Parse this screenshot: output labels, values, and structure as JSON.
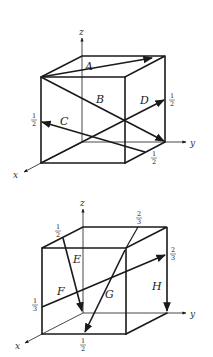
{
  "figure": {
    "panels": [
      {
        "id": "top",
        "axes": {
          "x": "x",
          "y": "y",
          "z": "z"
        },
        "vectors": [
          {
            "label": "A",
            "description": "top face diagonal from front-top-left corner to back-top-right region"
          },
          {
            "label": "B",
            "description": "body diagonal from front-top-left corner to back-bottom-right corner"
          },
          {
            "label": "C",
            "description": "from 1/2 point on bottom-right edge to 1/2 point on front-left vertical edge"
          },
          {
            "label": "D",
            "description": "from front-bottom-left corner to 1/2 point on back-right vertical edge"
          }
        ],
        "fractions": [
          {
            "value": "1/2",
            "num": "1",
            "den": "2",
            "position": "back-right edge (D tip)"
          },
          {
            "value": "1/2",
            "num": "1",
            "den": "2",
            "position": "front-left edge (C tip)"
          },
          {
            "value": "1/2",
            "num": "1",
            "den": "2",
            "position": "bottom-right edge (C tail)"
          }
        ]
      },
      {
        "id": "bottom",
        "axes": {
          "x": "x",
          "y": "y",
          "z": "z"
        },
        "vectors": [
          {
            "label": "E",
            "description": "from 1/2 point on top-left edge down to origin"
          },
          {
            "label": "F",
            "description": "from 1/3 point on front-left edge to 2/3 point on back-right edge"
          },
          {
            "label": "G",
            "description": "from 2/3 point on top-back edge through front-top-right corner to 1/2 point on front-bottom edge"
          },
          {
            "label": "H",
            "description": "down the back-right vertical edge"
          }
        ],
        "fractions": [
          {
            "value": "1/2",
            "num": "1",
            "den": "2",
            "position": "top-left edge (E tail)"
          },
          {
            "value": "2/3",
            "num": "2",
            "den": "3",
            "position": "top-back edge (G tail)"
          },
          {
            "value": "2/3",
            "num": "2",
            "den": "3",
            "position": "back-right edge (F tip)"
          },
          {
            "value": "1/3",
            "num": "1",
            "den": "3",
            "position": "front-left edge (F tail)"
          },
          {
            "value": "1/2",
            "num": "1",
            "den": "2",
            "position": "front-bottom edge (G tip)"
          }
        ]
      }
    ]
  }
}
